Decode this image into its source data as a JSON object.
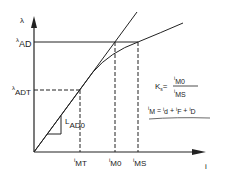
{
  "diagram": {
    "axes": {
      "y_label": "λ",
      "x_label": "i"
    },
    "y_levels": [
      {
        "base": "λ",
        "sub": "AD"
      },
      {
        "base": "λ",
        "sub": "ADT"
      }
    ],
    "x_marks": [
      {
        "base": "i",
        "sub": "MT"
      },
      {
        "base": "i",
        "sub": "M0"
      },
      {
        "base": "i",
        "sub": "MS"
      }
    ],
    "slope_label": {
      "base": "L",
      "sub": "AD0"
    },
    "equations": {
      "ks": {
        "lhs_base": "K",
        "lhs_sub": "s",
        "eq": "=",
        "num_base": "i",
        "num_sub": "M0",
        "den_base": "i",
        "den_sub": "MS"
      },
      "im": {
        "lhs_base": "i",
        "lhs_sub": "M",
        "eq": "=",
        "t1_base": "i",
        "t1_sub": "d",
        "plus1": "+",
        "t2_base": "i",
        "t2_sub": "F",
        "plus2": "+",
        "t3_base": "i",
        "t3_sub": "D"
      }
    },
    "colors": {
      "line": "#222222",
      "background": "#ffffff"
    }
  }
}
